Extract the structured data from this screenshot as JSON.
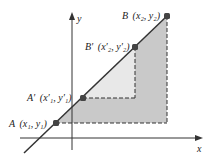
{
  "diagram": {
    "axes": {
      "x_label": "x",
      "y_label": "y"
    },
    "points": {
      "A": {
        "label": "A",
        "coords": "(x₁, y₁)"
      },
      "A_prime": {
        "label": "A′",
        "coords": "(x′₁, y′₁)"
      },
      "B_prime": {
        "label": "B′",
        "coords": "(x′₂, y′₂)"
      },
      "B": {
        "label": "B",
        "coords": "(x₂, y₂)"
      }
    },
    "colors": {
      "outer_triangle": "#c8c8c8",
      "inner_triangle": "#e6e6e6",
      "line": "#333333",
      "point": "#444444"
    }
  }
}
